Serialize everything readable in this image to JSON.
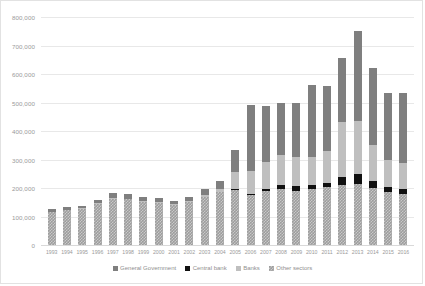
{
  "chart_data": {
    "type": "bar",
    "stacked": true,
    "title": "",
    "xlabel": "",
    "ylabel": "",
    "ylim": [
      0,
      800000
    ],
    "ytick_step": 100000,
    "ytick_labels": [
      "800,000",
      "700,000",
      "600,000",
      "500,000",
      "400,000",
      "300,000",
      "200,000",
      "100,000",
      "0"
    ],
    "ytick_values": [
      800000,
      700000,
      600000,
      500000,
      400000,
      300000,
      200000,
      100000,
      0
    ],
    "grid": true,
    "legend_position": "bottom",
    "categories": [
      "1993",
      "1994",
      "1995",
      "1996",
      "1997",
      "1998",
      "1999",
      "2000",
      "2001",
      "2002",
      "2003",
      "2004",
      "2005",
      "2006",
      "2007",
      "2008",
      "2009",
      "2010",
      "2011",
      "2012",
      "2013",
      "2014",
      "2015",
      "2016"
    ],
    "series": [
      {
        "name": "Other sectors",
        "color": "#9d9d9d",
        "pattern": "checkered",
        "values": [
          115000,
          122000,
          128000,
          145000,
          163000,
          160000,
          152000,
          148000,
          140000,
          150000,
          168000,
          185000,
          192000,
          175000,
          188000,
          195000,
          190000,
          196000,
          205000,
          210000,
          215000,
          200000,
          185000,
          180000
        ]
      },
      {
        "name": "Central bank",
        "color": "#111111",
        "values": [
          0,
          0,
          0,
          0,
          0,
          0,
          0,
          0,
          0,
          0,
          0,
          0,
          3000,
          5000,
          8000,
          15000,
          18000,
          16000,
          14000,
          30000,
          34000,
          26000,
          18000,
          17000
        ]
      },
      {
        "name": "Banks",
        "color": "#bfbfbf",
        "values": [
          2000,
          2000,
          2000,
          2000,
          3000,
          3000,
          3000,
          3000,
          3000,
          4000,
          6000,
          12000,
          60000,
          80000,
          95000,
          105000,
          100000,
          98000,
          110000,
          190000,
          185000,
          125000,
          95000,
          92000
        ]
      },
      {
        "name": "General Government",
        "color": "#7f7f7f",
        "values": [
          8000,
          8000,
          8000,
          10000,
          18000,
          17000,
          15000,
          14000,
          12000,
          14000,
          22000,
          28000,
          78000,
          230000,
          196000,
          184000,
          190000,
          250000,
          230000,
          225000,
          316000,
          270000,
          237000,
          246000
        ]
      }
    ],
    "totals": [
      125000,
      132000,
      138000,
      157000,
      184000,
      180000,
      170000,
      165000,
      155000,
      168000,
      196000,
      225000,
      333000,
      490000,
      487000,
      499000,
      498000,
      560000,
      559000,
      655000,
      750000,
      621000,
      535000,
      535000
    ]
  },
  "legend": {
    "items": [
      {
        "label": "General Government",
        "color": "#7f7f7f"
      },
      {
        "label": "Central bank",
        "color": "#111111"
      },
      {
        "label": "Banks",
        "color": "#bfbfbf"
      },
      {
        "label": "Other sectors",
        "color": "#9d9d9d"
      }
    ]
  }
}
